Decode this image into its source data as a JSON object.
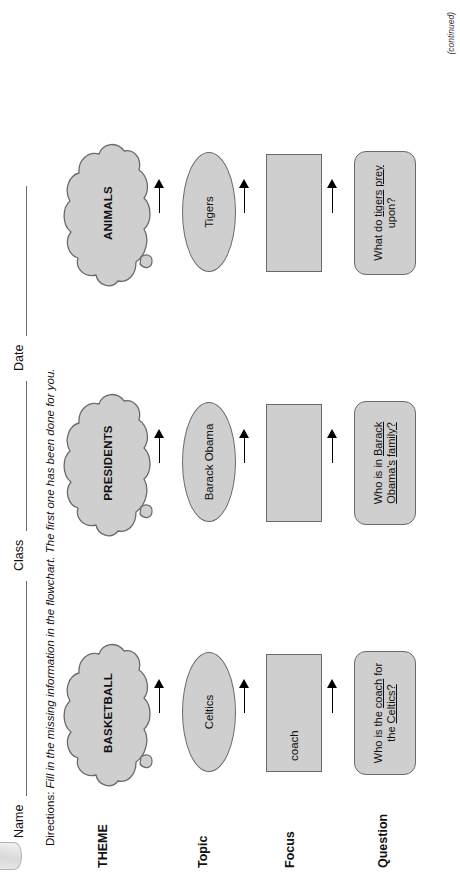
{
  "page": {
    "header": {
      "name_label": "Name",
      "class_label": "Class",
      "date_label": "Date"
    },
    "directions_prefix": "Directions:",
    "directions_text": "Fill in the missing information in the flowchart. The first one has been done for you.",
    "footer_note": "(continued)",
    "row_labels": [
      {
        "key": "theme",
        "label": "THEME"
      },
      {
        "key": "topic",
        "label": "Topic"
      },
      {
        "key": "focus",
        "label": "Focus"
      },
      {
        "key": "question",
        "label": "Question"
      }
    ],
    "columns": [
      {
        "theme": "BASKETBALL",
        "topic": "Celtics",
        "focus": "coach",
        "question_parts": [
          {
            "text": "Who is the ",
            "underline": false
          },
          {
            "text": "coach",
            "underline": true
          },
          {
            "text": " for the ",
            "underline": false
          },
          {
            "text": "Celtics?",
            "underline": true
          }
        ]
      },
      {
        "theme": "PRESIDENTS",
        "topic": "Barack Obama",
        "focus": "",
        "question_parts": [
          {
            "text": "Who is in ",
            "underline": false
          },
          {
            "text": "Barack Obama's",
            "underline": true
          },
          {
            "text": " ",
            "underline": false
          },
          {
            "text": "family?",
            "underline": true
          }
        ]
      },
      {
        "theme": "ANIMALS",
        "topic": "Tigers",
        "focus": "",
        "question_parts": [
          {
            "text": "What do ",
            "underline": false
          },
          {
            "text": "tigers",
            "underline": true
          },
          {
            "text": " ",
            "underline": false
          },
          {
            "text": "prey",
            "underline": true
          },
          {
            "text": " upon?",
            "underline": false
          }
        ]
      }
    ],
    "colors": {
      "shape_fill": "#cfcfcf",
      "shape_stroke": "#6a6a6a",
      "rule": "#6f6f6f",
      "text": "#111111",
      "paper": "#ffffff"
    }
  }
}
